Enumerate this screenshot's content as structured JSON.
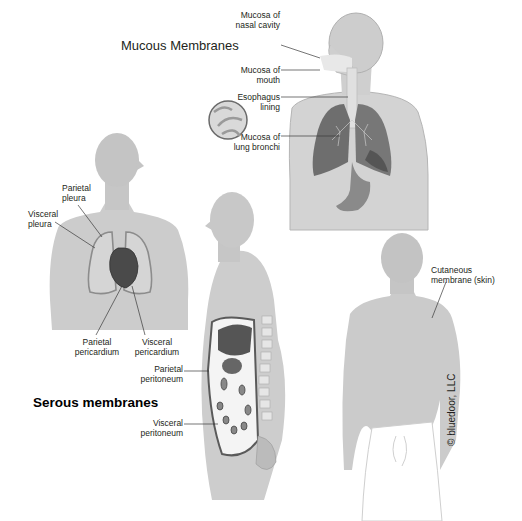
{
  "figure": {
    "colors": {
      "skin": "#c9c9c9",
      "skin_shadow": "#a9a9a9",
      "lung": "#6e6e6e",
      "heart": "#4a4a4a",
      "line": "#3a3a3a",
      "background": "#ffffff"
    },
    "mucous": {
      "title": "Mucous Membranes",
      "labels": [
        {
          "text": "Mucosa of\nnasal cavity"
        },
        {
          "text": "Mucosa of\nmouth"
        },
        {
          "text": "Esophagus\nlining"
        },
        {
          "text": "Mucosa of\nlung bronchi"
        }
      ]
    },
    "serous": {
      "title": "Serous membranes",
      "thorax_labels": [
        {
          "text": "Parietal\npleura"
        },
        {
          "text": "Visceral\npleura"
        },
        {
          "text": "Parietal\npericardium"
        },
        {
          "text": "Visceral\npericardium"
        }
      ],
      "abdomen_labels": [
        {
          "text": "Parietal\nperitoneum"
        },
        {
          "text": "Visceral\nperitoneum"
        }
      ]
    },
    "cutaneous": {
      "labels": [
        {
          "text": "Cutaneous\nmembrane (skin)"
        }
      ]
    },
    "copyright": "© bluedoor, LLC"
  }
}
